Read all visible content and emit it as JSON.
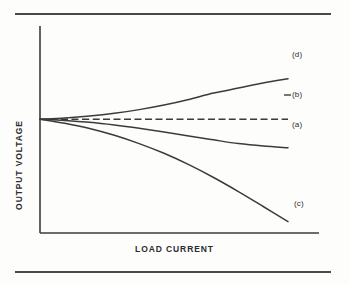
{
  "figure": {
    "background_color": "#fdfdfc",
    "ink_color": "#3b3b3b",
    "rules": {
      "top_label": "top-divider-rule",
      "bottom_label": "bottom-divider-rule"
    }
  },
  "axes": {
    "x_title": "LOAD CURRENT",
    "y_title": "OUTPUT VOLTAGE"
  },
  "labels": {
    "a": "(a)",
    "b": "(b)",
    "c": "(c)",
    "d": "(d)"
  },
  "chart_data": {
    "type": "line",
    "title": "",
    "subtitle": "",
    "xlabel": "LOAD CURRENT",
    "ylabel": "OUTPUT VOLTAGE",
    "xlim": [
      0,
      1
    ],
    "ylim": [
      0,
      1
    ],
    "grid": false,
    "axis_ticks": false,
    "legend": "inline-end-of-curve",
    "legend_position": "right",
    "annotations": [
      {
        "text": "(d)",
        "curve": "d",
        "x": 1.0,
        "y": 0.745
      },
      {
        "text": "(b)",
        "curve": "b",
        "x": 1.0,
        "y": 0.55
      },
      {
        "text": "(a)",
        "curve": "a",
        "x": 1.0,
        "y": 0.41
      },
      {
        "text": "(c)",
        "curve": "c",
        "x": 1.0,
        "y": 0.05
      }
    ],
    "series": [
      {
        "name": "(d)",
        "label": "(d)",
        "style": "solid",
        "color": "#3b3b3b",
        "behaviour": "rising",
        "x": [
          0.0,
          0.1,
          0.2,
          0.3,
          0.4,
          0.5,
          0.6,
          0.7,
          0.8,
          0.9,
          1.0
        ],
        "y": [
          0.55,
          0.556,
          0.565,
          0.578,
          0.596,
          0.618,
          0.645,
          0.676,
          0.7,
          0.725,
          0.745
        ]
      },
      {
        "name": "(b)",
        "label": "(b)",
        "style": "dashed",
        "color": "#3b3b3b",
        "behaviour": "flat",
        "x": [
          0.0,
          0.25,
          0.5,
          0.75,
          1.0
        ],
        "y": [
          0.55,
          0.55,
          0.55,
          0.55,
          0.55
        ]
      },
      {
        "name": "(a)",
        "label": "(a)",
        "style": "solid",
        "color": "#3b3b3b",
        "behaviour": "gently-drooping",
        "x": [
          0.0,
          0.1,
          0.2,
          0.3,
          0.4,
          0.5,
          0.6,
          0.7,
          0.8,
          0.9,
          1.0
        ],
        "y": [
          0.55,
          0.544,
          0.535,
          0.522,
          0.506,
          0.488,
          0.469,
          0.45,
          0.432,
          0.42,
          0.412
        ]
      },
      {
        "name": "(c)",
        "label": "(c)",
        "style": "solid",
        "color": "#3b3b3b",
        "behaviour": "steeply-drooping",
        "x": [
          0.0,
          0.1,
          0.2,
          0.3,
          0.4,
          0.5,
          0.6,
          0.7,
          0.8,
          0.9,
          1.0
        ],
        "y": [
          0.55,
          0.53,
          0.505,
          0.472,
          0.432,
          0.385,
          0.33,
          0.268,
          0.2,
          0.128,
          0.055
        ]
      }
    ]
  }
}
